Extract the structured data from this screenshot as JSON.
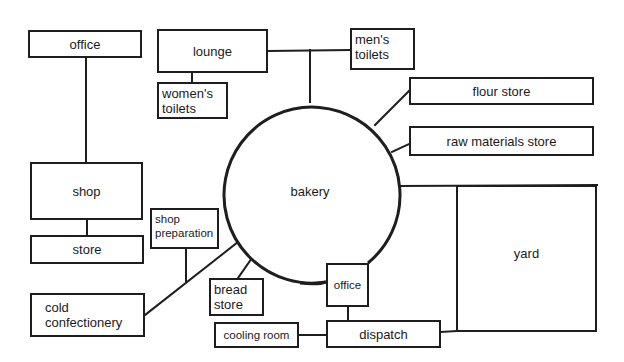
{
  "diagram": {
    "title": "",
    "type": "bakery layout flow diagram",
    "line_color": "#1e1e1e",
    "background": "#ffffff",
    "center": {
      "id": "bakery",
      "label": "bakery",
      "shape": "circle",
      "cx": 310,
      "cy": 190,
      "r": 88
    },
    "nodes": {
      "office_top": {
        "label": "office",
        "x": 28,
        "y": 30,
        "w": 114,
        "h": 28
      },
      "lounge": {
        "label": "lounge",
        "x": 157,
        "y": 29,
        "w": 111,
        "h": 44
      },
      "womens_toilets": {
        "label": "women's\ntoilets",
        "x": 157,
        "y": 82,
        "w": 71,
        "h": 37
      },
      "mens_toilets": {
        "label": "men's\ntoilets",
        "x": 350,
        "y": 28,
        "w": 65,
        "h": 42
      },
      "flour_store": {
        "label": "flour store",
        "x": 409,
        "y": 77,
        "w": 185,
        "h": 28
      },
      "raw_materials_store": {
        "label": "raw materials store",
        "x": 409,
        "y": 126,
        "w": 185,
        "h": 30
      },
      "shop": {
        "label": "shop",
        "x": 30,
        "y": 162,
        "w": 113,
        "h": 58
      },
      "store": {
        "label": "store",
        "x": 30,
        "y": 235,
        "w": 114,
        "h": 29
      },
      "shop_preparation": {
        "label": "shop\npreparation",
        "x": 150,
        "y": 208,
        "w": 69,
        "h": 41
      },
      "cold_confectionery": {
        "label": "cold\nconfectionery",
        "x": 30,
        "y": 293,
        "w": 115,
        "h": 44
      },
      "bread_store": {
        "label": "bread\nstore",
        "x": 209,
        "y": 278,
        "w": 55,
        "h": 38
      },
      "office_bottom": {
        "label": "office",
        "x": 326,
        "y": 263,
        "w": 43,
        "h": 44
      },
      "cooling_room": {
        "label": "cooling room",
        "x": 214,
        "y": 322,
        "w": 85,
        "h": 26
      },
      "dispatch": {
        "label": "dispatch",
        "x": 326,
        "y": 320,
        "w": 115,
        "h": 28
      },
      "yard": {
        "label": "yard",
        "x": 456,
        "y": 185,
        "w": 141,
        "h": 147
      }
    },
    "edges": [
      {
        "from": "office_top",
        "to": "shop"
      },
      {
        "from": "shop",
        "to": "store"
      },
      {
        "from": "lounge",
        "to": "womens_toilets"
      },
      {
        "from": "lounge",
        "to": "mens_toilets"
      },
      {
        "from": "lounge_mens_link",
        "to": "bakery"
      },
      {
        "from": "bakery",
        "to": "flour_store"
      },
      {
        "from": "bakery",
        "to": "raw_materials_store"
      },
      {
        "from": "bakery",
        "to": "yard"
      },
      {
        "from": "bakery",
        "to": "cold_confectionery"
      },
      {
        "from": "shop_preparation",
        "to": "cold_confectionery_link"
      },
      {
        "from": "bakery",
        "to": "bread_store"
      },
      {
        "from": "bakery",
        "to": "office_bottom"
      },
      {
        "from": "office_bottom",
        "to": "dispatch"
      },
      {
        "from": "cooling_room",
        "to": "dispatch"
      },
      {
        "from": "dispatch",
        "to": "yard"
      }
    ]
  }
}
